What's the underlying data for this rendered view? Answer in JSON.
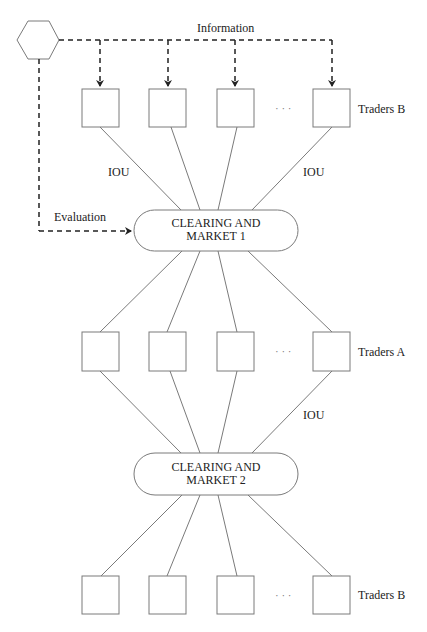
{
  "diagram": {
    "information_label": "Information",
    "evaluation_label": "Evaluation",
    "iou_label": "IOU",
    "ellipsis": "· · ·",
    "market1": {
      "line1": "CLEARING AND",
      "line2": "MARKET 1"
    },
    "market2": {
      "line1": "CLEARING AND",
      "line2": "MARKET 2"
    },
    "rows": {
      "top": {
        "label": "Traders B",
        "box_count_shown": 4
      },
      "middle": {
        "label": "Traders A",
        "box_count_shown": 4
      },
      "bottom": {
        "label": "Traders B",
        "box_count_shown": 4
      }
    },
    "colors": {
      "stroke": "#7a7a7a",
      "dashed": "#222222",
      "text": "#222222"
    }
  }
}
